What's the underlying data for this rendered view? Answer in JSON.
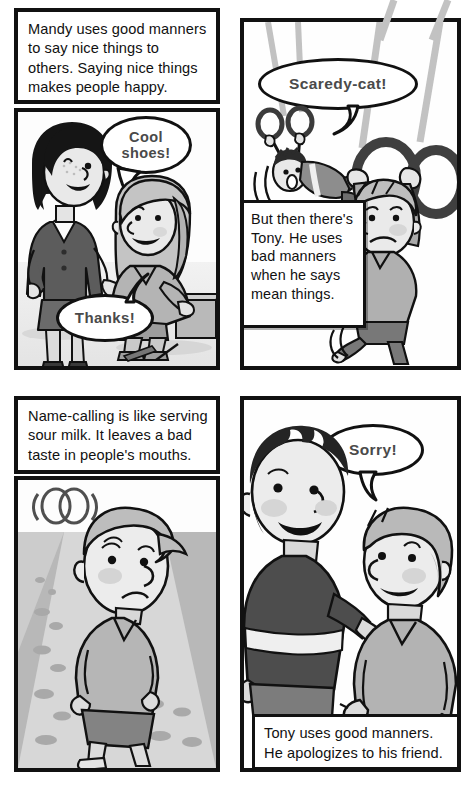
{
  "document": {
    "type": "comic-page",
    "title": "Good manners comic page",
    "page_width": 475,
    "page_height": 798
  },
  "palette": {
    "ink": "#111111",
    "balloon_text": "#4a4a4a",
    "skin": "#e8e8e8",
    "skin_shade": "#d2d2d2",
    "hair_light": "#bdbdbd",
    "hair_dark": "#2b2b2b",
    "shirt_light": "#bfbfbf",
    "shirt_dark": "#6e6e6e",
    "shirt_darkest": "#4a4a4a",
    "pants": "#8a8a8a",
    "floor_light": "#e9e9e9",
    "floor_mid": "#c9c9c9",
    "rope": "#c4c4c4",
    "paper": "#ffffff"
  },
  "panels": [
    {
      "id": "panel-1",
      "position": "top-left",
      "caption": "Mandy uses good manners to say nice things to others. Saying nice things makes people happy.",
      "caption_position": "top",
      "scene": "A woman in a dark suit compliments a girl sitting on a step.",
      "balloons": [
        {
          "id": "balloon-cool-shoes",
          "text": "Cool shoes!",
          "speaker": "Mandy"
        },
        {
          "id": "balloon-thanks",
          "text": "Thanks!",
          "speaker": "Girl"
        }
      ]
    },
    {
      "id": "panel-2",
      "position": "top-right",
      "caption": "But then there's Tony. He uses bad manners when he says mean things.",
      "caption_position": "middle-left",
      "scene": "A boy hanging from gymnastic rings taunts another boy swinging on rings.",
      "balloons": [
        {
          "id": "balloon-scaredy-cat",
          "text": "Scaredy-cat!",
          "speaker": "Tony"
        }
      ]
    },
    {
      "id": "panel-3",
      "position": "bottom-left",
      "caption": "Name-calling is like serving sour milk. It leaves a bad taste in people's mouths.",
      "caption_position": "top",
      "scene": "A sad boy walks away with a sour expression, stink lines above him.",
      "balloons": []
    },
    {
      "id": "panel-4",
      "position": "bottom-right",
      "caption": "Tony uses good manners. He apologizes to his friend.",
      "caption_position": "bottom",
      "scene": "Tony, in a dark shirt, apologizes to his smiling friend.",
      "balloons": [
        {
          "id": "balloon-sorry",
          "text": "Sorry!",
          "speaker": "Tony"
        }
      ]
    }
  ]
}
